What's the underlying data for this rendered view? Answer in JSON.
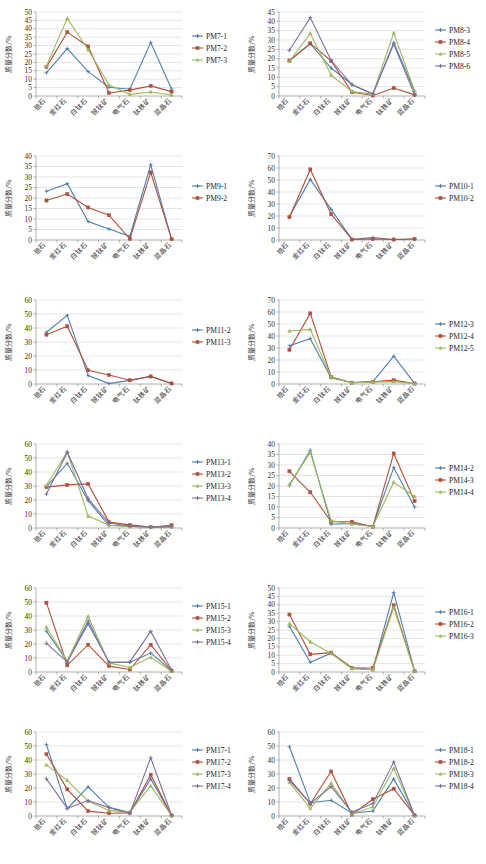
{
  "figure": {
    "axis_title_y": "质量分数/%",
    "categories": [
      "锆石",
      "金红石",
      "白钛石",
      "锐钛矿",
      "电气石",
      "钛铁矿",
      "蓝晶石"
    ],
    "palette": {
      "blue": "#4f7fad",
      "red": "#b0503c",
      "green": "#9bb85b",
      "purple": "#7e6f9e"
    }
  },
  "chart_data": [
    {
      "id": "PM7",
      "type": "line",
      "title": "",
      "xlabel": "",
      "ylabel": "质量分数/%",
      "categories": [
        "锆石",
        "金红石",
        "白钛石",
        "锐钛矿",
        "电气石",
        "钛铁矿",
        "蓝晶石"
      ],
      "ylim": [
        0,
        50
      ],
      "ytick_step": 5,
      "grid": true,
      "legend_position": "right",
      "series": [
        {
          "name": "PM7-1",
          "color": "#4f7fad",
          "values": [
            13.8,
            28.2,
            14.5,
            5.2,
            4.0,
            31.8,
            4.2
          ]
        },
        {
          "name": "PM7-2",
          "color": "#b0503c",
          "values": [
            17.2,
            38.0,
            29.5,
            1.8,
            3.5,
            6.0,
            2.6
          ]
        },
        {
          "name": "PM7-3",
          "color": "#9bb85b",
          "values": [
            17.8,
            46.2,
            27.5,
            6.5,
            1.0,
            2.4,
            0.6
          ]
        }
      ]
    },
    {
      "id": "PM8",
      "type": "line",
      "title": "",
      "xlabel": "",
      "ylabel": "质量分数/%",
      "categories": [
        "锆石",
        "金红石",
        "白钛石",
        "锐钛矿",
        "电气石",
        "钛铁矿",
        "蓝晶石"
      ],
      "ylim": [
        0,
        45
      ],
      "ytick_step": 5,
      "grid": true,
      "legend_position": "right",
      "series": [
        {
          "name": "PM8-3",
          "color": "#4f7fad",
          "values": [
            18.8,
            28.0,
            15.0,
            6.2,
            1.0,
            28.5,
            2.5
          ]
        },
        {
          "name": "PM8-4",
          "color": "#b0503c",
          "values": [
            19.0,
            28.2,
            18.8,
            2.0,
            0.3,
            4.3,
            0.6
          ]
        },
        {
          "name": "PM8-5",
          "color": "#9bb85b",
          "values": [
            18.6,
            33.5,
            11.2,
            2.4,
            1.0,
            33.8,
            2.8
          ]
        },
        {
          "name": "PM8-6",
          "color": "#7e6f9e",
          "values": [
            24.5,
            42.0,
            19.0,
            6.0,
            1.2,
            27.8,
            0.6
          ]
        }
      ]
    },
    {
      "id": "PM9",
      "type": "line",
      "title": "",
      "xlabel": "",
      "ylabel": "质量分数/%",
      "categories": [
        "锆石",
        "金红石",
        "白钛石",
        "锐钛矿",
        "电气石",
        "钛铁矿",
        "蓝晶石"
      ],
      "ylim": [
        0,
        40
      ],
      "ytick_step": 5,
      "grid": true,
      "legend_position": "right",
      "series": [
        {
          "name": "PM9-1",
          "color": "#4f7fad",
          "values": [
            23.2,
            26.8,
            8.8,
            5.2,
            1.8,
            35.8,
            0.3
          ]
        },
        {
          "name": "PM9-2",
          "color": "#b0503c",
          "values": [
            18.8,
            21.9,
            15.5,
            11.8,
            0.5,
            32.2,
            0.4
          ]
        }
      ]
    },
    {
      "id": "PM10",
      "type": "line",
      "title": "",
      "xlabel": "",
      "ylabel": "质量分数/%",
      "categories": [
        "锆石",
        "金红石",
        "白钛石",
        "锐钛矿",
        "电气石",
        "钛铁矿",
        "蓝晶石"
      ],
      "ylim": [
        0,
        70
      ],
      "ytick_step": 10,
      "grid": true,
      "legend_position": "right",
      "series": [
        {
          "name": "PM10-1",
          "color": "#4f7fad",
          "values": [
            19.5,
            50.5,
            25.5,
            0.5,
            2.0,
            0.4,
            0.8
          ]
        },
        {
          "name": "PM10-2",
          "color": "#b0503c",
          "values": [
            19.0,
            58.8,
            21.5,
            0.4,
            0.8,
            0.4,
            0.8
          ]
        }
      ]
    },
    {
      "id": "PM11",
      "type": "line",
      "title": "",
      "xlabel": "",
      "ylabel": "质量分数/%",
      "categories": [
        "锆石",
        "金红石",
        "白钛石",
        "锐钛矿",
        "电气石",
        "钛铁矿",
        "蓝晶石"
      ],
      "ylim": [
        0,
        60
      ],
      "ytick_step": 10,
      "grid": true,
      "legend_position": "right",
      "series": [
        {
          "name": "PM11-2",
          "color": "#4f7fad",
          "values": [
            37.0,
            49.0,
            6.0,
            0.3,
            2.6,
            5.4,
            0.3
          ]
        },
        {
          "name": "PM11-3",
          "color": "#b0503c",
          "values": [
            35.2,
            41.2,
            9.8,
            6.4,
            2.7,
            5.4,
            0.4
          ]
        }
      ]
    },
    {
      "id": "PM12",
      "type": "line",
      "title": "",
      "xlabel": "",
      "ylabel": "质量分数/%",
      "categories": [
        "锆石",
        "金红石",
        "白钛石",
        "锐钛矿",
        "电气石",
        "钛铁矿",
        "蓝晶石"
      ],
      "ylim": [
        0,
        70
      ],
      "ytick_step": 10,
      "grid": true,
      "legend_position": "right",
      "series": [
        {
          "name": "PM12-3",
          "color": "#4f7fad",
          "values": [
            31.8,
            37.8,
            5.0,
            1.2,
            2.0,
            23.2,
            0.5
          ]
        },
        {
          "name": "PM12-4",
          "color": "#b0503c",
          "values": [
            28.5,
            58.8,
            6.0,
            1.0,
            1.8,
            3.2,
            0.4
          ]
        },
        {
          "name": "PM12-5",
          "color": "#9bb85b",
          "values": [
            44.2,
            45.5,
            5.5,
            1.0,
            1.6,
            2.0,
            0.3
          ]
        }
      ]
    },
    {
      "id": "PM13",
      "type": "line",
      "title": "",
      "xlabel": "",
      "ylabel": "质量分数/%",
      "categories": [
        "锆石",
        "金红石",
        "白钛石",
        "锐钛矿",
        "电气石",
        "钛铁矿",
        "蓝晶石"
      ],
      "ylim": [
        0,
        60
      ],
      "ytick_step": 10,
      "grid": true,
      "legend_position": "right",
      "series": [
        {
          "name": "PM13-1",
          "color": "#4f7fad",
          "values": [
            29.5,
            46.2,
            19.5,
            1.8,
            1.5,
            0.6,
            1.0
          ]
        },
        {
          "name": "PM13-2",
          "color": "#b0503c",
          "values": [
            29.2,
            30.8,
            31.5,
            4.2,
            2.2,
            0.7,
            2.0
          ]
        },
        {
          "name": "PM13-3",
          "color": "#9bb85b",
          "values": [
            30.5,
            54.5,
            8.5,
            2.0,
            1.0,
            0.7,
            0.8
          ]
        },
        {
          "name": "PM13-4",
          "color": "#7e6f9e",
          "values": [
            24.2,
            54.0,
            21.0,
            3.5,
            1.2,
            0.6,
            0.9
          ]
        }
      ]
    },
    {
      "id": "PM14",
      "type": "line",
      "title": "",
      "xlabel": "",
      "ylabel": "质量分数/%",
      "categories": [
        "锆石",
        "金红石",
        "白钛石",
        "锐钛矿",
        "电气石",
        "钛铁矿",
        "蓝晶石"
      ],
      "ylim": [
        0,
        40
      ],
      "ytick_step": 5,
      "grid": true,
      "legend_position": "right",
      "series": [
        {
          "name": "PM14-2",
          "color": "#4f7fad",
          "values": [
            20.2,
            37.0,
            1.8,
            2.2,
            0.8,
            28.8,
            10.0
          ]
        },
        {
          "name": "PM14-3",
          "color": "#b0503c",
          "values": [
            27.0,
            17.0,
            3.0,
            3.0,
            0.6,
            35.5,
            12.8
          ]
        },
        {
          "name": "PM14-4",
          "color": "#9bb85b",
          "values": [
            20.8,
            36.0,
            3.5,
            1.8,
            0.7,
            21.8,
            15.0
          ]
        }
      ]
    },
    {
      "id": "PM15",
      "type": "line",
      "title": "",
      "xlabel": "",
      "ylabel": "质量分数/%",
      "categories": [
        "锆石",
        "金红石",
        "白钛石",
        "锐钛矿",
        "电气石",
        "钛铁矿",
        "蓝晶石"
      ],
      "ylim": [
        0,
        60
      ],
      "ytick_step": 10,
      "grid": true,
      "legend_position": "right",
      "series": [
        {
          "name": "PM15-1",
          "color": "#4f7fad",
          "values": [
            29.2,
            7.5,
            36.5,
            6.8,
            7.0,
            13.5,
            1.0
          ]
        },
        {
          "name": "PM15-2",
          "color": "#b0503c",
          "values": [
            49.5,
            4.8,
            19.5,
            4.2,
            1.8,
            19.5,
            0.8
          ]
        },
        {
          "name": "PM15-3",
          "color": "#9bb85b",
          "values": [
            32.0,
            7.8,
            39.8,
            6.5,
            3.2,
            10.5,
            0.5
          ]
        },
        {
          "name": "PM15-4",
          "color": "#7e6f9e",
          "values": [
            20.5,
            7.2,
            34.5,
            7.0,
            7.2,
            29.0,
            1.5
          ]
        }
      ]
    },
    {
      "id": "PM16",
      "type": "line",
      "title": "",
      "xlabel": "",
      "ylabel": "质量分数/%",
      "categories": [
        "锆石",
        "金红石",
        "白钛石",
        "锐钛矿",
        "电气石",
        "钛铁矿",
        "蓝晶石"
      ],
      "ylim": [
        0,
        50
      ],
      "ytick_step": 5,
      "grid": true,
      "legend_position": "right",
      "series": [
        {
          "name": "PM16-1",
          "color": "#4f7fad",
          "values": [
            27.2,
            5.8,
            11.2,
            2.5,
            1.5,
            47.2,
            0.5
          ]
        },
        {
          "name": "PM16-2",
          "color": "#b0503c",
          "values": [
            34.2,
            10.5,
            11.5,
            2.2,
            2.5,
            39.8,
            0.4
          ]
        },
        {
          "name": "PM16-3",
          "color": "#9bb85b",
          "values": [
            28.8,
            18.0,
            11.0,
            2.0,
            1.2,
            38.5,
            0.3
          ]
        }
      ]
    },
    {
      "id": "PM17",
      "type": "line",
      "title": "",
      "xlabel": "",
      "ylabel": "质量分数/%",
      "categories": [
        "锆石",
        "金红石",
        "白钛石",
        "锐钛矿",
        "电气石",
        "钛铁矿",
        "蓝晶石"
      ],
      "ylim": [
        0,
        60
      ],
      "ytick_step": 10,
      "grid": true,
      "legend_position": "right",
      "series": [
        {
          "name": "PM17-1",
          "color": "#4f7fad",
          "values": [
            51.0,
            5.2,
            20.8,
            6.2,
            2.5,
            26.5,
            0.4
          ]
        },
        {
          "name": "PM17-2",
          "color": "#b0503c",
          "values": [
            44.2,
            19.0,
            3.5,
            2.0,
            2.2,
            29.5,
            0.4
          ]
        },
        {
          "name": "PM17-3",
          "color": "#9bb85b",
          "values": [
            36.5,
            25.5,
            10.5,
            4.0,
            2.8,
            21.5,
            0.3
          ]
        },
        {
          "name": "PM17-4",
          "color": "#7e6f9e",
          "values": [
            26.5,
            5.5,
            11.0,
            6.0,
            2.0,
            41.5,
            0.5
          ]
        }
      ]
    },
    {
      "id": "PM18",
      "type": "line",
      "title": "",
      "xlabel": "",
      "ylabel": "质量分数/%",
      "categories": [
        "锆石",
        "金红石",
        "白钛石",
        "锐钛矿",
        "电气石",
        "钛铁矿",
        "蓝晶石"
      ],
      "ylim": [
        0,
        60
      ],
      "ytick_step": 10,
      "grid": true,
      "legend_position": "right",
      "series": [
        {
          "name": "PM18-1",
          "color": "#4f7fad",
          "values": [
            49.5,
            9.5,
            11.2,
            2.0,
            3.5,
            26.5,
            0.3
          ]
        },
        {
          "name": "PM18-2",
          "color": "#b0503c",
          "values": [
            26.5,
            8.8,
            31.8,
            1.0,
            12.0,
            19.5,
            0.4
          ]
        },
        {
          "name": "PM18-3",
          "color": "#9bb85b",
          "values": [
            24.0,
            5.5,
            23.5,
            1.5,
            6.5,
            34.0,
            0.3
          ]
        },
        {
          "name": "PM18-4",
          "color": "#7e6f9e",
          "values": [
            25.5,
            9.0,
            21.0,
            2.8,
            9.0,
            38.5,
            0.4
          ]
        }
      ]
    }
  ]
}
